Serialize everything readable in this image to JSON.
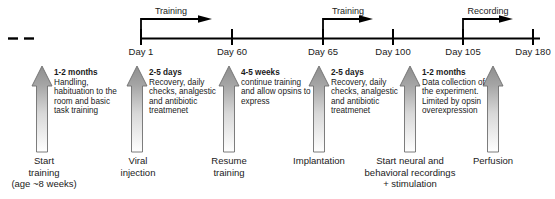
{
  "figure": {
    "kind": "experimental-timeline",
    "colors": {
      "line": "#000000",
      "text": "#1a1a1a",
      "arrow_fill_top": "#9a9a9a",
      "arrow_fill_bottom": "#ffffff",
      "arrow_stroke": "#5a5a5a",
      "background": "#ffffff"
    }
  },
  "axis": {
    "break_marks": "dashes",
    "ticks": [
      {
        "id": "day1",
        "label": "Day 1",
        "day": 1,
        "x": 141
      },
      {
        "id": "day60",
        "label": "Day 60",
        "day": 60,
        "x": 232
      },
      {
        "id": "day65",
        "label": "Day 65",
        "day": 65,
        "x": 323
      },
      {
        "id": "day100",
        "label": "Day 100",
        "day": 100,
        "x": 393
      },
      {
        "id": "day105",
        "label": "Day 105",
        "day": 105,
        "x": 463
      },
      {
        "id": "day180",
        "label": "Day 180",
        "day": 180,
        "x": 533
      }
    ]
  },
  "phases": [
    {
      "id": "phase-training-1",
      "label": "Training",
      "from": "Day 1",
      "to": "Day 60"
    },
    {
      "id": "phase-training-2",
      "label": "Training",
      "from": "Day 65",
      "to": "Day 100"
    },
    {
      "id": "phase-recording",
      "label": "Recording",
      "from": "Day 105",
      "to": "Day 180"
    }
  ],
  "steps": [
    {
      "id": "step-start-training",
      "duration": "1-2 months",
      "description": "Handling, habituation to the room and basic task training",
      "event_lines": [
        "Start",
        "training",
        "(age ~8 weeks)"
      ]
    },
    {
      "id": "step-viral-injection",
      "duration": "2-5 days",
      "description": "Recovery, daily checks, analgestic and antibiotic treatmenet",
      "event_lines": [
        "Viral",
        "injection"
      ]
    },
    {
      "id": "step-resume-training",
      "duration": "4-5 weeks",
      "description": "continue training and allow opsins to express",
      "event_lines": [
        "Resume",
        "training"
      ]
    },
    {
      "id": "step-implantation",
      "duration": "2-5 days",
      "description": "Recovery, daily checks, analgestic and antibiotic treatmenet",
      "event_lines": [
        "Implantation"
      ]
    },
    {
      "id": "step-start-recordings",
      "duration": "1-2 months",
      "description": "Data collection of the experiment. Limited by opsin overexpression",
      "event_lines": [
        "Start neural and",
        "behavioral recordings",
        "+ stimulation"
      ]
    },
    {
      "id": "step-perfusion",
      "duration": "",
      "description": "",
      "event_lines": [
        "Perfusion"
      ]
    }
  ]
}
